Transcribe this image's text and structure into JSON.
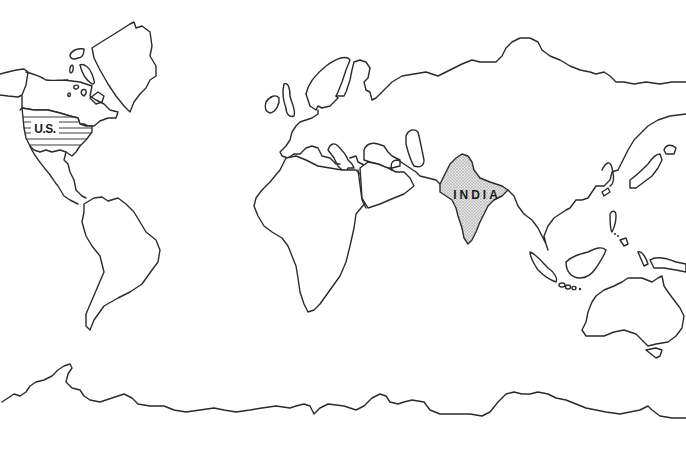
{
  "map": {
    "type": "outline world map",
    "colors": {
      "background": "#ffffff",
      "outline": "#2b2b2b",
      "highlight_stipple": "#9a9a9a",
      "highlight_stripes": "#3a3a3a",
      "label": "#1a1a1a"
    },
    "highlighted_countries": [
      {
        "id": "us",
        "label": "U.S.",
        "fill_style": "horizontal stripes"
      },
      {
        "id": "india",
        "label": "INDIA",
        "fill_style": "stippled"
      }
    ],
    "landmasses": [
      "North America",
      "Greenland",
      "Canadian Arctic Islands",
      "Central America",
      "South America",
      "Europe",
      "British Isles",
      "Scandinavia",
      "Asia",
      "Africa",
      "Arabian Peninsula",
      "Japan",
      "Southeast Asia",
      "Sumatra",
      "Borneo",
      "Philippines",
      "New Guinea",
      "Australia",
      "Tasmania",
      "Antarctica"
    ]
  }
}
